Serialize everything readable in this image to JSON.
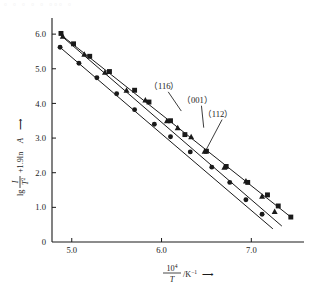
{
  "figure": {
    "ghost_text": "▫ ▫ ▫  ▫ ▫  ▫▫▫  ▫",
    "background_color": "#ffffff",
    "ink_color": "#1a1a1a"
  },
  "axes": {
    "x": {
      "label_numerator": "10",
      "label_numerator_exp": "4",
      "label_denominator": "T",
      "label_unit": "/K",
      "label_unit_exp": "−1",
      "label_arrow": "⟶",
      "origin_label": "0",
      "ticks": [
        "5.0",
        "6.0",
        "7.0"
      ],
      "tick_values": [
        5.0,
        6.0,
        7.0
      ],
      "range": [
        4.78,
        7.52
      ]
    },
    "y": {
      "label_lg": "lg",
      "label_frac_num": "I",
      "label_frac_den": "T",
      "label_frac_den_exp": "2",
      "label_plus": "+1.9ln",
      "label_A": "A",
      "label_arrow": "⟶",
      "ticks": [
        "0",
        "1.0",
        "2.0",
        "3.0",
        "4.0",
        "5.0",
        "6.0"
      ],
      "tick_values": [
        0,
        1.0,
        2.0,
        3.0,
        4.0,
        5.0,
        6.0
      ],
      "range": [
        0,
        6.35
      ]
    }
  },
  "chart_data": {
    "type": "scatter",
    "title": "",
    "xlabel": "10^4/T /K^-1",
    "ylabel": "lg I/T^2 + 1.9 lnA",
    "xlim": [
      4.78,
      7.52
    ],
    "ylim": [
      0,
      6.35
    ],
    "grid": false,
    "legend_position": "inline-annotations",
    "series": [
      {
        "name": "(116)",
        "marker": "square",
        "label_x": 6.03,
        "label_y": 4.42,
        "leader_to_x": 6.22,
        "leader_to_y": 3.78,
        "fit_line": {
          "x": [
            4.86,
            7.44
          ],
          "y": [
            6.02,
            0.72
          ]
        },
        "points": [
          {
            "x": 4.88,
            "y": 6.02
          },
          {
            "x": 5.02,
            "y": 5.72
          },
          {
            "x": 5.2,
            "y": 5.36
          },
          {
            "x": 5.42,
            "y": 4.92
          },
          {
            "x": 5.7,
            "y": 4.38
          },
          {
            "x": 5.86,
            "y": 4.04
          },
          {
            "x": 6.1,
            "y": 3.5
          },
          {
            "x": 6.26,
            "y": 3.1
          },
          {
            "x": 6.5,
            "y": 2.62
          },
          {
            "x": 6.72,
            "y": 2.18
          },
          {
            "x": 6.96,
            "y": 1.72
          },
          {
            "x": 7.18,
            "y": 1.36
          },
          {
            "x": 7.3,
            "y": 1.04
          },
          {
            "x": 7.44,
            "y": 0.72
          }
        ]
      },
      {
        "name": "(001)",
        "marker": "triangle",
        "label_x": 6.4,
        "label_y": 4.02,
        "leader_to_x": 6.47,
        "leader_to_y": 3.3,
        "fit_line": {
          "x": [
            4.88,
            7.34
          ],
          "y": [
            5.96,
            0.46
          ]
        },
        "points": [
          {
            "x": 4.9,
            "y": 5.94
          },
          {
            "x": 5.14,
            "y": 5.42
          },
          {
            "x": 5.37,
            "y": 4.9
          },
          {
            "x": 5.61,
            "y": 4.38
          },
          {
            "x": 5.82,
            "y": 4.1
          },
          {
            "x": 6.06,
            "y": 3.5
          },
          {
            "x": 6.18,
            "y": 3.3
          },
          {
            "x": 6.33,
            "y": 3.04
          },
          {
            "x": 6.48,
            "y": 2.62
          },
          {
            "x": 6.7,
            "y": 2.16
          },
          {
            "x": 6.94,
            "y": 1.76
          },
          {
            "x": 7.12,
            "y": 1.32
          },
          {
            "x": 7.26,
            "y": 0.88
          }
        ]
      },
      {
        "name": "(112)",
        "marker": "circle",
        "label_x": 6.63,
        "label_y": 3.62,
        "leader_to_x": 6.48,
        "leader_to_y": 2.58,
        "fit_line": {
          "x": [
            4.86,
            7.24
          ],
          "y": [
            5.64,
            0.38
          ]
        },
        "points": [
          {
            "x": 4.87,
            "y": 5.62
          },
          {
            "x": 5.08,
            "y": 5.16
          },
          {
            "x": 5.28,
            "y": 4.74
          },
          {
            "x": 5.5,
            "y": 4.28
          },
          {
            "x": 5.7,
            "y": 3.82
          },
          {
            "x": 5.92,
            "y": 3.4
          },
          {
            "x": 6.1,
            "y": 3.04
          },
          {
            "x": 6.32,
            "y": 2.6
          },
          {
            "x": 6.56,
            "y": 2.16
          },
          {
            "x": 6.76,
            "y": 1.72
          },
          {
            "x": 6.94,
            "y": 1.22
          },
          {
            "x": 7.12,
            "y": 0.8
          }
        ]
      }
    ]
  }
}
